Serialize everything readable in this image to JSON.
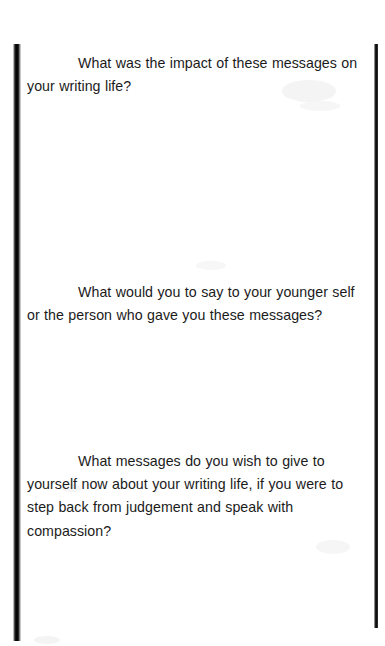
{
  "document": {
    "page_background": "#ffffff",
    "text_color": "#1b1b1b",
    "scan_bar_color": "#000000",
    "kind": "scanned-worksheet-page"
  },
  "prompts": [
    {
      "id": "prompt-impact-of-messages",
      "text": "What was the impact of these messages on your writing life?"
    },
    {
      "id": "prompt-say-to-younger-self",
      "text": "What would you to say to your younger self or the person who gave you these messages?"
    },
    {
      "id": "prompt-messages-of-compassion",
      "text": "What messages do you wish to give to yourself now about your writing life, if you were to step back from judgement and speak with compassion?"
    }
  ],
  "answer_spaces": [
    {
      "id": "answer-space-1",
      "text": ""
    },
    {
      "id": "answer-space-2",
      "text": ""
    },
    {
      "id": "answer-space-3",
      "text": ""
    }
  ]
}
